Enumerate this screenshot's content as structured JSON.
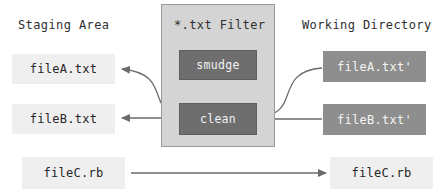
{
  "diagram": {
    "colors": {
      "background": "#ffffff",
      "filter_panel": "#d4d4d4",
      "filter_panel_border": "#9a9a9a",
      "process_box": "#6e6e6e",
      "process_text": "#f2f2f2",
      "file_label_bg": "#efefef",
      "file_label_text": "#262626",
      "working_file_bg": "#8e8e8e",
      "working_file_text": "#f4f4f4",
      "arrow": "#6b6b6b",
      "header_text": "#2f2f2f"
    }
  },
  "headers": {
    "staging": "Staging Area",
    "filter": "*.txt Filter",
    "working": "Working Directory"
  },
  "processes": {
    "smudge": "smudge",
    "clean": "clean"
  },
  "staging_files": [
    {
      "label": "fileA.txt"
    },
    {
      "label": "fileB.txt"
    },
    {
      "label": "fileC.rb"
    }
  ],
  "working_files": [
    {
      "label": "fileA.txt'"
    },
    {
      "label": "fileB.txt'"
    },
    {
      "label": "fileC.rb"
    }
  ],
  "arrows": [
    {
      "name": "clean-to-fileA",
      "from": "clean",
      "to": "fileA.txt",
      "style": "curved"
    },
    {
      "name": "clean-to-fileB",
      "from": "clean",
      "to": "fileB.txt",
      "style": "straight"
    },
    {
      "name": "fileA-prime-to-clean",
      "from": "fileA.txt'",
      "to": "clean",
      "style": "curved"
    },
    {
      "name": "fileB-prime-to-clean",
      "from": "fileB.txt'",
      "to": "clean",
      "style": "straight"
    },
    {
      "name": "fileC-passthrough",
      "from": "fileC.rb",
      "to": "fileC.rb",
      "style": "straight"
    }
  ]
}
